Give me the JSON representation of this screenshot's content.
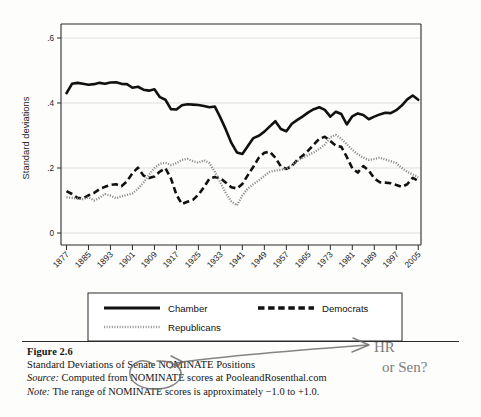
{
  "figure": {
    "number_label": "Figure 2.6",
    "title": "Standard Deviations of Senate NOMINATE Positions",
    "source_label": "Source:",
    "source_text": "Computed from NOMINATE scores at PooleandRosenthal.com",
    "note_label": "Note:",
    "note_text": "The range of NOMINATE scores is approximately −1.0 to +1.0."
  },
  "annotation": {
    "hand_note_line1": "HR",
    "hand_note_line2": "or Sen?",
    "target_phrase": "Senate"
  },
  "legend": {
    "items": [
      {
        "label": "Chamber",
        "style": "solid",
        "color": "#111111"
      },
      {
        "label": "Democrats",
        "style": "dashed",
        "color": "#111111"
      },
      {
        "label": "Republicans",
        "style": "dotted",
        "color": "#9a9a9a"
      }
    ]
  },
  "chart_data": {
    "type": "line",
    "title": "",
    "xlabel": "",
    "ylabel": "Standard deviations",
    "xlim": [
      1875,
      2006
    ],
    "ylim": [
      0,
      0.62
    ],
    "yticks": [
      0,
      0.2,
      0.4,
      0.6
    ],
    "ytick_labels": [
      "0",
      ".2",
      ".4",
      ".6"
    ],
    "xticks": [
      1877,
      1885,
      1893,
      1901,
      1909,
      1917,
      1925,
      1933,
      1941,
      1949,
      1957,
      1965,
      1973,
      1981,
      1989,
      1997,
      2005
    ],
    "xtick_labels": [
      "1877",
      "1885",
      "1893",
      "1901",
      "1909",
      "1917",
      "1925",
      "1933",
      "1941",
      "1949",
      "1957",
      "1965",
      "1973",
      "1981",
      "1989",
      "1997",
      "2005"
    ],
    "grid": "horizontal",
    "legend_position": "below-plot",
    "x": [
      1877,
      1879,
      1881,
      1883,
      1885,
      1887,
      1889,
      1891,
      1893,
      1895,
      1897,
      1899,
      1901,
      1903,
      1905,
      1907,
      1909,
      1911,
      1913,
      1915,
      1917,
      1919,
      1921,
      1923,
      1925,
      1927,
      1929,
      1931,
      1933,
      1935,
      1937,
      1939,
      1941,
      1943,
      1945,
      1947,
      1949,
      1951,
      1953,
      1955,
      1957,
      1959,
      1961,
      1963,
      1965,
      1967,
      1969,
      1971,
      1973,
      1975,
      1977,
      1979,
      1981,
      1983,
      1985,
      1987,
      1989,
      1991,
      1993,
      1995,
      1997,
      1999,
      2001,
      2003,
      2005
    ],
    "series": [
      {
        "name": "Chamber",
        "style": "solid",
        "values": [
          0.43,
          0.459,
          0.462,
          0.459,
          0.456,
          0.458,
          0.462,
          0.459,
          0.463,
          0.464,
          0.459,
          0.458,
          0.447,
          0.45,
          0.441,
          0.438,
          0.442,
          0.418,
          0.41,
          0.381,
          0.38,
          0.393,
          0.396,
          0.395,
          0.394,
          0.391,
          0.387,
          0.389,
          0.355,
          0.318,
          0.277,
          0.248,
          0.243,
          0.268,
          0.292,
          0.299,
          0.312,
          0.328,
          0.344,
          0.32,
          0.313,
          0.336,
          0.348,
          0.359,
          0.371,
          0.381,
          0.387,
          0.379,
          0.358,
          0.373,
          0.366,
          0.334,
          0.359,
          0.368,
          0.363,
          0.35,
          0.358,
          0.365,
          0.37,
          0.369,
          0.378,
          0.392,
          0.411,
          0.423,
          0.41
        ]
      },
      {
        "name": "Democrats",
        "style": "dashed",
        "values": [
          0.129,
          0.12,
          0.108,
          0.106,
          0.116,
          0.123,
          0.135,
          0.142,
          0.148,
          0.15,
          0.144,
          0.159,
          0.184,
          0.201,
          0.177,
          0.169,
          0.174,
          0.189,
          0.199,
          0.168,
          0.118,
          0.089,
          0.096,
          0.102,
          0.118,
          0.141,
          0.167,
          0.172,
          0.169,
          0.155,
          0.141,
          0.137,
          0.151,
          0.178,
          0.204,
          0.232,
          0.247,
          0.25,
          0.232,
          0.205,
          0.197,
          0.206,
          0.225,
          0.238,
          0.254,
          0.272,
          0.29,
          0.296,
          0.283,
          0.269,
          0.265,
          0.234,
          0.199,
          0.186,
          0.206,
          0.192,
          0.168,
          0.156,
          0.155,
          0.153,
          0.148,
          0.142,
          0.15,
          0.17,
          0.16
        ]
      },
      {
        "name": "Republicans",
        "style": "dotted",
        "values": [
          0.11,
          0.108,
          0.106,
          0.104,
          0.11,
          0.1,
          0.108,
          0.12,
          0.115,
          0.107,
          0.113,
          0.117,
          0.122,
          0.136,
          0.155,
          0.179,
          0.2,
          0.213,
          0.216,
          0.209,
          0.215,
          0.225,
          0.228,
          0.221,
          0.216,
          0.224,
          0.215,
          0.188,
          0.155,
          0.122,
          0.097,
          0.085,
          0.116,
          0.137,
          0.15,
          0.162,
          0.176,
          0.188,
          0.192,
          0.194,
          0.198,
          0.209,
          0.221,
          0.232,
          0.24,
          0.248,
          0.259,
          0.272,
          0.295,
          0.302,
          0.29,
          0.273,
          0.256,
          0.242,
          0.232,
          0.225,
          0.228,
          0.232,
          0.226,
          0.221,
          0.215,
          0.2,
          0.188,
          0.18,
          0.172
        ]
      }
    ]
  }
}
